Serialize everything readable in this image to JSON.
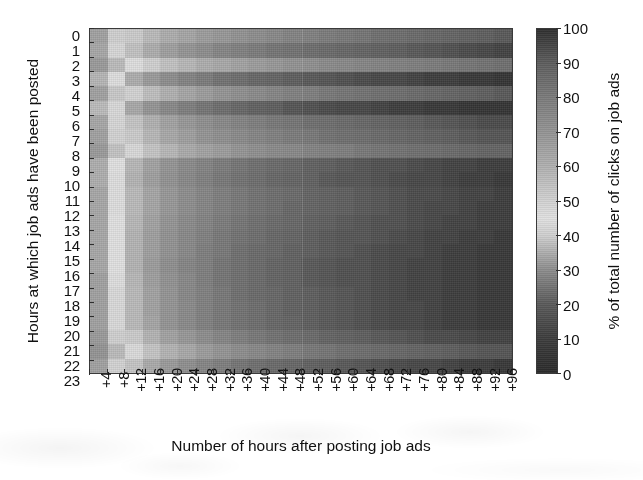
{
  "figure": {
    "x_axis_title": "Number of hours after posting job ads",
    "y_axis_title": "Hours at which job ads have been posted",
    "colorbar_title": "% of total number of clicks on job ads"
  },
  "chart_data": {
    "type": "heatmap",
    "title": "",
    "xlabel": "Number of hours after posting job ads",
    "ylabel": "Hours at which job ads have been posted",
    "colorbar_label": "% of total number of clicks on job ads",
    "colorbar_ticks": [
      0,
      10,
      20,
      30,
      40,
      50,
      60,
      70,
      80,
      90,
      100
    ],
    "zlim": [
      0,
      100
    ],
    "grid": false,
    "legend_position": "right-colorbar",
    "x": [
      "+4",
      "+8",
      "+12",
      "+16",
      "+20",
      "+24",
      "+28",
      "+32",
      "+36",
      "+40",
      "+44",
      "+48",
      "+52",
      "+56",
      "+60",
      "+64",
      "+68",
      "+72",
      "+76",
      "+80",
      "+84",
      "+88",
      "+92",
      "+96"
    ],
    "y": [
      "0",
      "1",
      "2",
      "3",
      "4",
      "5",
      "6",
      "7",
      "8",
      "9",
      "10",
      "11",
      "12",
      "13",
      "14",
      "15",
      "16",
      "17",
      "18",
      "19",
      "20",
      "21",
      "22",
      "23"
    ],
    "values": [
      [
        33,
        40,
        52,
        57,
        61,
        64,
        67,
        69,
        71,
        73,
        75,
        77,
        78,
        80,
        81,
        82,
        84,
        85,
        86,
        87,
        88,
        89,
        90,
        91
      ],
      [
        34,
        42,
        55,
        61,
        66,
        70,
        73,
        76,
        78,
        80,
        82,
        83,
        85,
        86,
        87,
        88,
        89,
        90,
        91,
        92,
        93,
        94,
        95,
        96
      ],
      [
        32,
        37,
        46,
        51,
        55,
        58,
        61,
        63,
        65,
        67,
        69,
        71,
        72,
        74,
        75,
        76,
        77,
        78,
        79,
        80,
        81,
        82,
        83,
        84
      ],
      [
        36,
        46,
        61,
        68,
        73,
        77,
        80,
        83,
        85,
        87,
        88,
        90,
        91,
        92,
        93,
        94,
        95,
        95,
        96,
        97,
        97,
        98,
        98,
        99
      ],
      [
        33,
        39,
        50,
        56,
        60,
        64,
        67,
        70,
        72,
        74,
        76,
        78,
        79,
        81,
        82,
        83,
        84,
        85,
        86,
        87,
        88,
        89,
        90,
        91
      ],
      [
        37,
        48,
        63,
        70,
        75,
        79,
        82,
        85,
        87,
        89,
        90,
        92,
        93,
        94,
        95,
        95,
        96,
        97,
        97,
        98,
        98,
        99,
        99,
        99
      ],
      [
        34,
        42,
        54,
        60,
        65,
        69,
        72,
        75,
        77,
        79,
        81,
        82,
        84,
        85,
        86,
        87,
        88,
        89,
        90,
        91,
        92,
        93,
        94,
        94
      ],
      [
        33,
        41,
        52,
        58,
        63,
        66,
        70,
        72,
        74,
        76,
        78,
        80,
        81,
        83,
        84,
        85,
        86,
        87,
        88,
        89,
        90,
        91,
        92,
        92
      ],
      [
        32,
        38,
        48,
        54,
        58,
        62,
        65,
        67,
        70,
        72,
        74,
        75,
        77,
        78,
        79,
        81,
        82,
        83,
        84,
        85,
        86,
        87,
        88,
        88
      ],
      [
        35,
        45,
        58,
        65,
        70,
        74,
        77,
        80,
        82,
        84,
        86,
        87,
        89,
        90,
        91,
        92,
        93,
        93,
        94,
        95,
        96,
        96,
        97,
        97
      ],
      [
        35,
        46,
        59,
        66,
        71,
        75,
        78,
        81,
        83,
        85,
        87,
        88,
        89,
        91,
        92,
        92,
        93,
        94,
        95,
        95,
        96,
        97,
        97,
        98
      ],
      [
        34,
        44,
        57,
        64,
        69,
        73,
        76,
        79,
        81,
        83,
        85,
        86,
        88,
        89,
        90,
        91,
        92,
        93,
        94,
        94,
        95,
        96,
        96,
        97
      ],
      [
        34,
        44,
        57,
        64,
        69,
        73,
        76,
        79,
        81,
        83,
        85,
        87,
        88,
        89,
        90,
        91,
        92,
        93,
        94,
        95,
        95,
        96,
        97,
        97
      ],
      [
        34,
        45,
        58,
        65,
        70,
        74,
        77,
        80,
        82,
        84,
        86,
        87,
        89,
        90,
        91,
        92,
        93,
        93,
        94,
        95,
        96,
        96,
        97,
        97
      ],
      [
        34,
        45,
        59,
        66,
        71,
        75,
        78,
        81,
        83,
        85,
        87,
        88,
        90,
        91,
        92,
        92,
        93,
        94,
        95,
        96,
        96,
        97,
        97,
        98
      ],
      [
        34,
        45,
        59,
        66,
        71,
        75,
        79,
        81,
        84,
        86,
        87,
        89,
        90,
        91,
        92,
        93,
        94,
        95,
        95,
        96,
        97,
        97,
        98,
        98
      ],
      [
        34,
        45,
        59,
        67,
        72,
        76,
        79,
        82,
        84,
        86,
        88,
        89,
        91,
        92,
        93,
        93,
        94,
        95,
        96,
        96,
        97,
        97,
        98,
        98
      ],
      [
        33,
        44,
        58,
        66,
        71,
        75,
        79,
        82,
        84,
        86,
        88,
        89,
        91,
        92,
        93,
        93,
        94,
        95,
        96,
        96,
        97,
        97,
        98,
        98
      ],
      [
        33,
        43,
        57,
        65,
        70,
        75,
        78,
        81,
        84,
        86,
        87,
        89,
        90,
        91,
        92,
        93,
        94,
        95,
        96,
        96,
        97,
        97,
        98,
        98
      ],
      [
        33,
        43,
        57,
        65,
        70,
        74,
        78,
        81,
        83,
        85,
        87,
        89,
        90,
        91,
        92,
        93,
        94,
        95,
        95,
        96,
        97,
        97,
        98,
        98
      ],
      [
        33,
        43,
        57,
        64,
        70,
        74,
        78,
        81,
        83,
        85,
        87,
        88,
        90,
        91,
        92,
        93,
        94,
        95,
        95,
        96,
        97,
        97,
        98,
        98
      ],
      [
        32,
        40,
        52,
        59,
        65,
        69,
        73,
        76,
        79,
        81,
        83,
        85,
        86,
        88,
        89,
        90,
        91,
        92,
        93,
        94,
        94,
        95,
        96,
        96
      ],
      [
        31,
        37,
        47,
        54,
        59,
        63,
        67,
        70,
        73,
        75,
        77,
        79,
        81,
        82,
        84,
        85,
        86,
        87,
        88,
        89,
        90,
        91,
        92,
        92
      ],
      [
        33,
        41,
        54,
        62,
        68,
        72,
        76,
        79,
        82,
        84,
        86,
        87,
        89,
        90,
        91,
        92,
        93,
        94,
        95,
        95,
        96,
        97,
        97,
        98
      ]
    ]
  },
  "colormap": {
    "description": "grayscale scan of a diverging map: dark at 0, brightest near 45, dark again at 100",
    "stops": [
      {
        "value": 0,
        "hex": "#2b2b2b"
      },
      {
        "value": 10,
        "hex": "#3d3d3d"
      },
      {
        "value": 20,
        "hex": "#5a5a5a"
      },
      {
        "value": 30,
        "hex": "#8d8d8d"
      },
      {
        "value": 40,
        "hex": "#cfcfcf"
      },
      {
        "value": 45,
        "hex": "#e0e0e0"
      },
      {
        "value": 50,
        "hex": "#d2d2d2"
      },
      {
        "value": 60,
        "hex": "#b0b0b0"
      },
      {
        "value": 70,
        "hex": "#949494"
      },
      {
        "value": 80,
        "hex": "#7b7b7b"
      },
      {
        "value": 90,
        "hex": "#5e5e5e"
      },
      {
        "value": 100,
        "hex": "#2f2f2f"
      }
    ]
  }
}
